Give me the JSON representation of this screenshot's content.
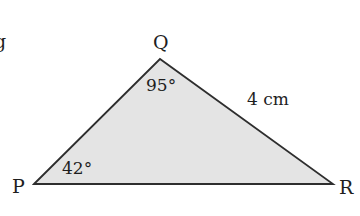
{
  "figure": {
    "type": "triangle",
    "fill_color": "#e4e4e4",
    "stroke_color": "#2e2e2e",
    "vertices": {
      "P": {
        "label": "P",
        "x": 34,
        "y": 184
      },
      "Q": {
        "label": "Q",
        "x": 160,
        "y": 59
      },
      "R": {
        "label": "R",
        "x": 333,
        "y": 184
      }
    },
    "angles": {
      "Q": "95°",
      "P": "42°"
    },
    "sides": {
      "QR": "4 cm"
    },
    "edge_fragment": "g"
  }
}
